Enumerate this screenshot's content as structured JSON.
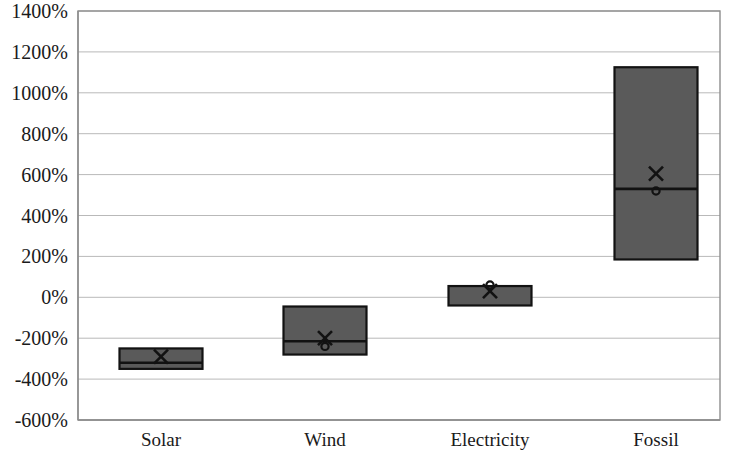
{
  "chart_data": {
    "type": "bar",
    "chart_style": "box-range",
    "title": "",
    "subtitle": "",
    "xlabel": "",
    "ylabel": "",
    "categories": [
      "Solar",
      "Wind",
      "Electricity",
      "Fossil"
    ],
    "ylim": [
      -600,
      1400
    ],
    "ytick_step": 200,
    "ytick_labels": [
      "1400%",
      "1200%",
      "1000%",
      "800%",
      "600%",
      "400%",
      "200%",
      "0%",
      "-200%",
      "-400%",
      "-600%"
    ],
    "ytick_values": [
      1400,
      1200,
      1000,
      800,
      600,
      400,
      200,
      0,
      -200,
      -400,
      -600
    ],
    "grid": true,
    "legend": false,
    "legend_position": "none",
    "value_unit": "percent",
    "series": [
      {
        "name": "Range box (low to high)",
        "low": [
          -350,
          -280,
          -40,
          185
        ],
        "high": [
          -250,
          -45,
          55,
          1125
        ]
      },
      {
        "name": "Median line",
        "values": [
          -320,
          -215,
          null,
          530
        ]
      },
      {
        "name": "Mean marker (x)",
        "marker": "x",
        "values": [
          -290,
          -200,
          30,
          605
        ]
      },
      {
        "name": "Point marker (o)",
        "marker": "circle",
        "values": [
          null,
          -240,
          60,
          520
        ]
      }
    ],
    "box_fill_color": "#5a5a5a",
    "box_edge_color": "#121212",
    "gridline_color": "#b9b9b9",
    "axis_color": "#8e8e8e",
    "background_color": "#ffffff"
  },
  "plot_geometry": {
    "left": 78,
    "right": 720,
    "top": 11,
    "bottom": 420,
    "category_centers": [
      161,
      325,
      490,
      656
    ],
    "box_width": 83
  }
}
